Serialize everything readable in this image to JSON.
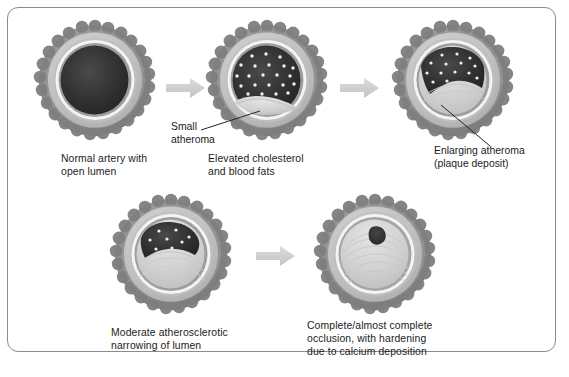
{
  "figure": {
    "frame_border_color": "#8c8c8c",
    "background_color": "#ffffff",
    "arrow_color": "#d0d0d0",
    "leader_line_color": "#262626",
    "text_color": "#1b1b1b"
  },
  "palette": {
    "adventitia_outer": "#8f8f8f",
    "adventitia_bumps": "#7a7a7a",
    "media_light": "#c9c9c9",
    "media_mid": "#b3b3b3",
    "internal_elastic_white": "#f2f2f2",
    "intima_ring": "#9a9a9a",
    "lumen_dark": "#2b2b2b",
    "lumen_dark_soft": "#3a3a3a",
    "plaque_light": "#d8d8d8",
    "plaque_mid": "#c2c2c2",
    "cholesterol_dot": "#f0f0f0"
  },
  "stages": [
    {
      "id": "stage-1-normal",
      "index": 1,
      "caption": "Normal artery with\nopen lumen",
      "lumen_state": "open",
      "lumen_fill_percent": 100,
      "cholesterol_dots": 0,
      "plaque_present": false,
      "callout": null
    },
    {
      "id": "stage-2-elevated-cholesterol",
      "index": 2,
      "caption": "Elevated cholesterol\nand blood fats",
      "lumen_state": "open-with-lipids",
      "lumen_fill_percent": 92,
      "cholesterol_dots": 22,
      "plaque_present": true,
      "callout": {
        "label": "Small\natheroma",
        "points_to": "small-atheroma-at-lumen-floor"
      }
    },
    {
      "id": "stage-3-enlarging-atheroma",
      "index": 3,
      "caption": "",
      "lumen_state": "mildly-narrowed",
      "lumen_fill_percent": 72,
      "cholesterol_dots": 14,
      "plaque_present": true,
      "callout": {
        "label": "Enlarging atheroma\n(plaque deposit)",
        "points_to": "enlarging-plaque-deposit"
      }
    },
    {
      "id": "stage-4-moderate-narrowing",
      "index": 4,
      "caption": "Moderate atherosclerotic\nnarrowing of lumen",
      "lumen_state": "moderately-narrowed",
      "lumen_fill_percent": 35,
      "cholesterol_dots": 8,
      "plaque_present": true,
      "callout": null
    },
    {
      "id": "stage-5-complete-occlusion",
      "index": 5,
      "caption": "Complete/almost complete\nocclusion, with hardening\ndue to calcium deposition",
      "lumen_state": "occluded",
      "lumen_fill_percent": 4,
      "cholesterol_dots": 0,
      "plaque_present": true,
      "callout": null
    }
  ],
  "arrows": [
    {
      "id": "arrow-1-2",
      "from": "stage-1-normal",
      "to": "stage-2-elevated-cholesterol",
      "direction": "right"
    },
    {
      "id": "arrow-2-3",
      "from": "stage-2-elevated-cholesterol",
      "to": "stage-3-enlarging-atheroma",
      "direction": "right"
    },
    {
      "id": "arrow-4-5",
      "from": "stage-4-moderate-narrowing",
      "to": "stage-5-complete-occlusion",
      "direction": "right"
    }
  ]
}
